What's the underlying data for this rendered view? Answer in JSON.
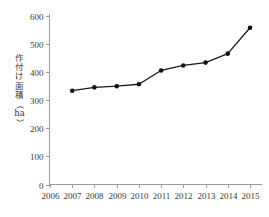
{
  "chart_data": {
    "type": "line",
    "title": "",
    "subtitle": "",
    "xlabel": "",
    "ylabel": "作付け面積（ha）",
    "ylabel_chars": [
      "作",
      "付",
      "け",
      "面",
      "積",
      "（",
      "ha",
      "）"
    ],
    "categories": [
      "2006",
      "2007",
      "2008",
      "2009",
      "2010",
      "2011",
      "2012",
      "2013",
      "2014",
      "2015"
    ],
    "x_tick_labels": [
      "2006",
      "2007",
      "2008",
      "2009",
      "2010",
      "2011",
      "2012",
      "2013",
      "2014",
      "2015"
    ],
    "y_tick_labels": [
      "0",
      "100",
      "200",
      "300",
      "400",
      "500",
      "600"
    ],
    "y_tick_values": [
      0,
      100,
      200,
      300,
      400,
      500,
      600
    ],
    "ylim": [
      0,
      600
    ],
    "xlim": [
      "2006",
      "2015"
    ],
    "grid": false,
    "legend": false,
    "legend_position": "none",
    "series": [
      {
        "name": "作付け面積",
        "marker": "filled-circle",
        "color": "#111111",
        "points": [
          {
            "x": "2007",
            "y": 334
          },
          {
            "x": "2008",
            "y": 346
          },
          {
            "x": "2009",
            "y": 350
          },
          {
            "x": "2010",
            "y": 357
          },
          {
            "x": "2011",
            "y": 406
          },
          {
            "x": "2012",
            "y": 424
          },
          {
            "x": "2013",
            "y": 434
          },
          {
            "x": "2014",
            "y": 466
          },
          {
            "x": "2015",
            "y": 558
          }
        ]
      }
    ]
  },
  "colors": {
    "axis": "#9a9a9a",
    "text": "#3a3a3a",
    "series": "#111111",
    "background": "#ffffff"
  }
}
